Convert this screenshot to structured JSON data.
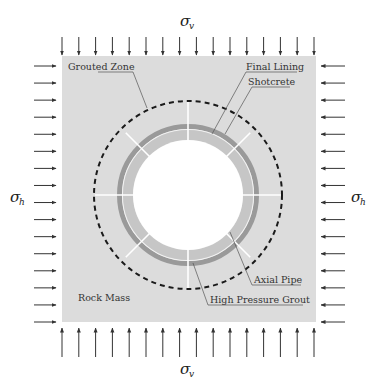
{
  "diagram": {
    "title": "",
    "colors": {
      "rock_mass": "#dcdcdc",
      "final_lining": "#9a9a9a",
      "shotcrete": "#c4c4c4",
      "tunnel_opening": "#ffffff",
      "grouted_zone_boundary": "#1a1a1a",
      "arrows": "#333333",
      "axial_pipes": "#ffffff"
    },
    "labels": {
      "sigma_v_top": "σ",
      "sigma_v_top_sub": "v",
      "sigma_v_bottom": "σ",
      "sigma_v_bottom_sub": "v",
      "sigma_h_left": "σ",
      "sigma_h_left_sub": "h",
      "sigma_h_right": "σ",
      "sigma_h_right_sub": "h",
      "grouted_zone": "Grouted Zone",
      "final_lining": "Final Lining",
      "shotcrete": "Shotcrete",
      "rock_mass": "Rock Mass",
      "axial_pipe": "Axial Pipe",
      "high_pressure_grout": "High Pressure Grout"
    },
    "loads": {
      "vertical_arrows_top": 16,
      "vertical_arrows_bottom": 16,
      "horizontal_arrows_left": 16,
      "horizontal_arrows_right": 16
    },
    "geometry": {
      "center": [
        188,
        195
      ],
      "grouted_zone_radius": 94,
      "final_lining_outer_radius": 71,
      "shotcrete_outer_radius": 66,
      "opening_radius": 55,
      "axial_pipe_count": 8
    }
  }
}
